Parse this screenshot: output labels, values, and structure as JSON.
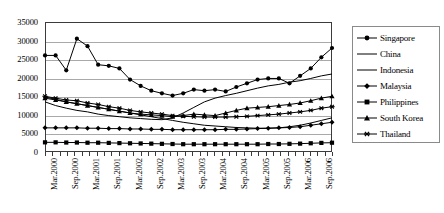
{
  "chart_data": {
    "type": "line",
    "title": "",
    "xlabel": "",
    "ylabel": "",
    "ylim": [
      0,
      35000
    ],
    "ytick_values": [
      0,
      5000,
      10000,
      15000,
      20000,
      25000,
      30000,
      35000
    ],
    "ytick_labels": [
      "0",
      "5000",
      "10000",
      "15000",
      "20000",
      "25000",
      "30000",
      "35000"
    ],
    "grid": true,
    "legend_position": "right",
    "x_tick_count": 40,
    "xtick_labels": [
      "Mar.2000",
      "Sep.2000",
      "Mar.2001",
      "Sep.2001",
      "Mar.2002",
      "Sep.2002",
      "Mar.2003",
      "Sep.2003",
      "Mar.2004",
      "Sep.2004",
      "Mar.2005",
      "Sep.2005",
      "Mar.2006",
      "Sep.2006"
    ],
    "x": [
      "Mar.2000",
      "Jun.2000",
      "Sep.2000",
      "Dec.2000",
      "Mar.2001",
      "Jun.2001",
      "Sep.2001",
      "Dec.2001",
      "Mar.2002",
      "Jun.2002",
      "Sep.2002",
      "Dec.2002",
      "Mar.2003",
      "Jun.2003",
      "Sep.2003",
      "Dec.2003",
      "Mar.2004",
      "Jun.2004",
      "Sep.2004",
      "Dec.2004",
      "Mar.2005",
      "Jun.2005",
      "Sep.2005",
      "Dec.2005",
      "Mar.2006",
      "Jun.2006",
      "Sep.2006",
      "Dec.2006"
    ],
    "series": [
      {
        "name": "Singapore",
        "marker": "filled-circle",
        "values": [
          26000,
          26000,
          22000,
          30500,
          28500,
          23500,
          23200,
          22500,
          19500,
          17800,
          16500,
          15800,
          15200,
          15800,
          16800,
          16500,
          16800,
          16300,
          17500,
          18500,
          19500,
          19800,
          19800,
          18500,
          20500,
          22500,
          25500,
          28000
        ]
      },
      {
        "name": "China",
        "marker": "none",
        "values": [
          13500,
          12500,
          11800,
          11200,
          10800,
          10200,
          9800,
          9500,
          9200,
          9000,
          8800,
          8700,
          9200,
          10500,
          12000,
          13500,
          14500,
          15200,
          15800,
          16500,
          17200,
          17800,
          18200,
          18800,
          19200,
          19800,
          20500,
          21000
        ]
      },
      {
        "name": "Indonesia",
        "marker": "none",
        "values": [
          14800,
          14200,
          13500,
          13000,
          12500,
          12000,
          11500,
          11000,
          10500,
          10000,
          9500,
          9000,
          8500,
          8000,
          7600,
          7200,
          7000,
          6800,
          6600,
          6500,
          6400,
          6400,
          6500,
          6800,
          7200,
          7800,
          8500,
          9200
        ]
      },
      {
        "name": "Malaysia",
        "marker": "filled-diamond",
        "values": [
          6500,
          6500,
          6500,
          6500,
          6400,
          6400,
          6300,
          6300,
          6200,
          6200,
          6100,
          6100,
          6000,
          6000,
          6000,
          6000,
          6000,
          6100,
          6100,
          6200,
          6300,
          6400,
          6500,
          6600,
          6800,
          7200,
          7600,
          8000
        ]
      },
      {
        "name": "Philippines",
        "marker": "filled-square",
        "values": [
          2600,
          2600,
          2550,
          2550,
          2500,
          2500,
          2450,
          2400,
          2350,
          2300,
          2250,
          2200,
          2150,
          2100,
          2100,
          2100,
          2100,
          2100,
          2100,
          2100,
          2100,
          2150,
          2150,
          2200,
          2250,
          2350,
          2450,
          2500
        ]
      },
      {
        "name": "South Korea",
        "marker": "filled-triangle",
        "values": [
          14500,
          14000,
          13500,
          13000,
          12500,
          12000,
          11500,
          11000,
          10500,
          10200,
          10000,
          9800,
          9500,
          9800,
          10200,
          10000,
          9800,
          10500,
          11200,
          11800,
          12000,
          12200,
          12500,
          12800,
          13200,
          13800,
          14500,
          15000
        ]
      },
      {
        "name": "Thailand",
        "marker": "star",
        "values": [
          15000,
          14500,
          14000,
          13800,
          13200,
          12800,
          12200,
          11800,
          11200,
          10800,
          10500,
          10200,
          9800,
          9600,
          9500,
          9400,
          9400,
          9400,
          9500,
          9600,
          9800,
          10000,
          10200,
          10500,
          10800,
          11200,
          11800,
          12200
        ]
      }
    ]
  },
  "legend": {
    "entries": [
      {
        "label": "Singapore",
        "marker": "filled-circle"
      },
      {
        "label": "China",
        "marker": "none"
      },
      {
        "label": "Indonesia",
        "marker": "none"
      },
      {
        "label": "Malaysia",
        "marker": "filled-diamond"
      },
      {
        "label": "Philippines",
        "marker": "filled-square"
      },
      {
        "label": "South Korea",
        "marker": "filled-triangle"
      },
      {
        "label": "Thailand",
        "marker": "star"
      }
    ]
  },
  "colors": {
    "line": "#000000",
    "grid": "#a9a9a9",
    "frame": "#3b3b3b",
    "legend_border": "#8a8a8a",
    "background": "#ffffff"
  }
}
